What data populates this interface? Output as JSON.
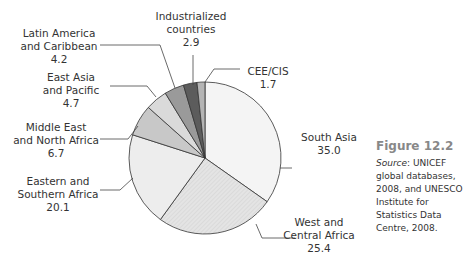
{
  "figure": {
    "title": "Figure 12.2",
    "source_label": "Source",
    "source_text": ": UNICEF global databases, 2008, and UNESCO Institute for Statistics Data Centre, 2008."
  },
  "chart_data": {
    "type": "pie",
    "title": "",
    "unit": "percent",
    "start_angle_deg": 0,
    "direction": "clockwise",
    "slices": [
      {
        "name": "South Asia",
        "value": 35.0,
        "color": "#f4f4f4"
      },
      {
        "name": "West and Central Africa",
        "value": 25.4,
        "color": "#e2e2e2"
      },
      {
        "name": "Eastern and Southern Africa",
        "value": 20.1,
        "color": "#ededed"
      },
      {
        "name": "Middle East and North Africa",
        "value": 6.7,
        "color": "#c8c8c8"
      },
      {
        "name": "East Asia and Pacific",
        "value": 4.7,
        "color": "#dadada"
      },
      {
        "name": "Latin America and Caribbean",
        "value": 4.2,
        "color": "#9a9a9a"
      },
      {
        "name": "Industrialized countries",
        "value": 2.9,
        "color": "#5c5c5c"
      },
      {
        "name": "CEE/CIS",
        "value": 1.7,
        "color": "#b4b4b4"
      }
    ],
    "labels": [
      {
        "lines": [
          "South Asia",
          "35.0"
        ],
        "x": 329,
        "y": 131
      },
      {
        "lines": [
          "West and",
          "Central Africa",
          "25.4"
        ],
        "x": 319,
        "y": 216
      },
      {
        "lines": [
          "Eastern and",
          "Southern Africa",
          "20.1"
        ],
        "x": 58,
        "y": 175
      },
      {
        "lines": [
          "Middle East",
          "and North Africa",
          "6.7"
        ],
        "x": 56,
        "y": 121
      },
      {
        "lines": [
          "East Asia",
          "and Pacific",
          "4.7"
        ],
        "x": 71,
        "y": 71
      },
      {
        "lines": [
          "Latin America",
          "and Caribbean",
          "4.2"
        ],
        "x": 59,
        "y": 27
      },
      {
        "lines": [
          "Industrialized",
          "countries",
          "2.9"
        ],
        "x": 191,
        "y": 10
      },
      {
        "lines": [
          "CEE/CIS",
          "1.7"
        ],
        "x": 268,
        "y": 65
      }
    ],
    "leaders": [
      [
        [
          280,
          168
        ],
        [
          292,
          168
        ]
      ],
      [
        [
          256,
          224
        ],
        [
          262,
          238
        ],
        [
          295,
          238
        ]
      ],
      [
        [
          133,
          178
        ],
        [
          120,
          190
        ],
        [
          100,
          190
        ]
      ],
      [
        [
          138,
          126
        ],
        [
          128,
          139
        ],
        [
          100,
          139
        ]
      ],
      [
        [
          156,
          97
        ],
        [
          147,
          86
        ],
        [
          110,
          86
        ]
      ],
      [
        [
          175,
          88
        ],
        [
          160,
          45
        ],
        [
          100,
          45
        ]
      ],
      [
        [
          193,
          85
        ],
        [
          193,
          55
        ]
      ],
      [
        [
          205,
          82
        ],
        [
          214,
          69
        ],
        [
          240,
          69
        ]
      ]
    ]
  }
}
